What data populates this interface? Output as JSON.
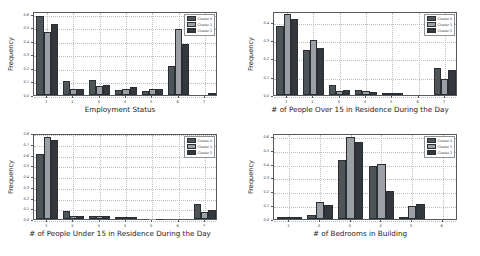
{
  "figure": {
    "background": "#ffffff",
    "panel_count": 4,
    "legend_labels": [
      "Cluster 0",
      "Cluster 1",
      "Cluster 2"
    ],
    "series_colors": [
      "#4e5559",
      "#9aa0a4",
      "#33383c"
    ]
  },
  "chart_data": [
    {
      "type": "bar",
      "title": "",
      "xlabel": "Employment Status",
      "ylabel": "Frequency",
      "categories": [
        "1",
        "2",
        "3",
        "4",
        "5",
        "6",
        "7"
      ],
      "xlim": [
        0.5,
        7.5
      ],
      "ylim": [
        0.0,
        0.62
      ],
      "yticks": [
        "0.0",
        "0.1",
        "0.2",
        "0.3",
        "0.4",
        "0.5",
        "0.6"
      ],
      "ytick_values": [
        0.0,
        0.1,
        0.2,
        0.3,
        0.4,
        0.5,
        0.6
      ],
      "grid": true,
      "legend_position": "upper right",
      "series": [
        {
          "name": "Cluster 0",
          "values": [
            0.585,
            0.101,
            0.113,
            0.037,
            0.031,
            0.215,
            0.0
          ]
        },
        {
          "name": "Cluster 1",
          "values": [
            0.468,
            0.042,
            0.066,
            0.043,
            0.041,
            0.484,
            0.0
          ]
        },
        {
          "name": "Cluster 2",
          "values": [
            0.522,
            0.041,
            0.073,
            0.056,
            0.044,
            0.378,
            0.011
          ]
        }
      ]
    },
    {
      "type": "bar",
      "title": "",
      "xlabel": "# of People Over 15 in Residence During the Day",
      "ylabel": "Frequency",
      "categories": [
        "1",
        "2",
        "3",
        "4",
        "5",
        "6",
        "7"
      ],
      "xlim": [
        0.5,
        7.5
      ],
      "ylim": [
        0.0,
        0.46
      ],
      "yticks": [
        "0.0",
        "0.1",
        "0.2",
        "0.3",
        "0.4"
      ],
      "ytick_values": [
        0.0,
        0.1,
        0.2,
        0.3,
        0.4
      ],
      "grid": true,
      "legend_position": "upper right",
      "series": [
        {
          "name": "Cluster 0",
          "values": [
            0.378,
            0.249,
            0.056,
            0.028,
            0.006,
            0.0,
            0.148
          ]
        },
        {
          "name": "Cluster 1",
          "values": [
            0.444,
            0.299,
            0.022,
            0.021,
            0.003,
            0.0,
            0.086
          ]
        },
        {
          "name": "Cluster 2",
          "values": [
            0.417,
            0.256,
            0.03,
            0.017,
            0.003,
            0.0,
            0.137
          ]
        }
      ]
    },
    {
      "type": "bar",
      "title": "",
      "xlabel": "# of People Under 15 in Residence During the Day",
      "ylabel": "Frequency",
      "categories": [
        "1",
        "2",
        "3",
        "4",
        "5",
        "6",
        "7"
      ],
      "xlim": [
        0.5,
        7.5
      ],
      "ylim": [
        0.0,
        0.8
      ],
      "yticks": [
        "0.0",
        "0.1",
        "0.2",
        "0.3",
        "0.4",
        "0.5",
        "0.6",
        "0.7",
        "0.8"
      ],
      "ytick_values": [
        0.0,
        0.1,
        0.2,
        0.3,
        0.4,
        0.5,
        0.6,
        0.7,
        0.8
      ],
      "grid": true,
      "legend_position": "upper right",
      "series": [
        {
          "name": "Cluster 0",
          "values": [
            0.606,
            0.073,
            0.031,
            0.007,
            0.003,
            0.0,
            0.137
          ]
        },
        {
          "name": "Cluster 1",
          "values": [
            0.764,
            0.03,
            0.029,
            0.005,
            0.002,
            0.0,
            0.062
          ]
        },
        {
          "name": "Cluster 2",
          "values": [
            0.733,
            0.03,
            0.029,
            0.006,
            0.002,
            0.0,
            0.081
          ]
        }
      ]
    },
    {
      "type": "bar",
      "title": "",
      "xlabel": "# of Bedrooms in Building",
      "ylabel": "Frequency",
      "categories": [
        "1",
        "2",
        "3",
        "4",
        "5",
        "6"
      ],
      "xlim": [
        0.5,
        6.5
      ],
      "ylim": [
        0.0,
        0.62
      ],
      "yticks": [
        "0.0",
        "0.1",
        "0.2",
        "0.3",
        "0.4",
        "0.5",
        "0.6"
      ],
      "ytick_values": [
        0.0,
        0.1,
        0.2,
        0.3,
        0.4,
        0.5,
        0.6
      ],
      "grid": true,
      "legend_position": "upper right",
      "series": [
        {
          "name": "Cluster 0",
          "values": [
            0.006,
            0.03,
            0.424,
            0.38,
            0.009,
            0.0
          ]
        },
        {
          "name": "Cluster 1",
          "values": [
            0.011,
            0.122,
            0.588,
            0.397,
            0.093,
            0.0
          ]
        },
        {
          "name": "Cluster 2",
          "values": [
            0.01,
            0.1,
            0.558,
            0.204,
            0.106,
            0.0
          ]
        }
      ]
    }
  ]
}
